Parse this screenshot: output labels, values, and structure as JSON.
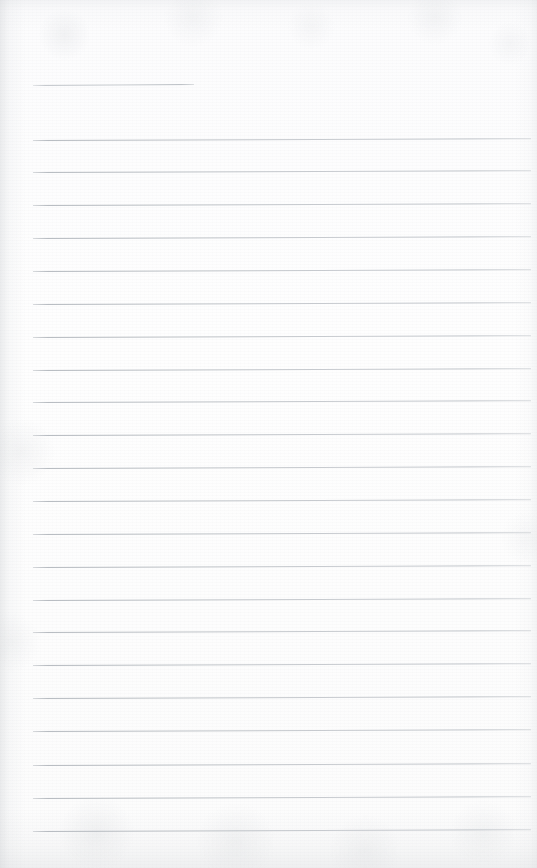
{
  "page": {
    "kind": "blank-lined-notebook-page",
    "width": 537,
    "height": 868,
    "paper_color": "#fdfdfd",
    "rule_color": "#b4b9bf",
    "edge_shadow_color": "#c6c9cd",
    "content_text": "",
    "has_handwriting": false,
    "has_printed_text": false
  },
  "header_rule": {
    "name": "short-header-rule",
    "x": 33,
    "y": 85,
    "width": 161,
    "tilt_deg": -0.35,
    "thickness": 1
  },
  "ruling": {
    "left_margin": 33,
    "right_edge": 531,
    "first_line_y": 140,
    "line_spacing": 32.9,
    "line_count": 22,
    "thickness": 1,
    "tilt_deg": -0.2,
    "lines": [
      {
        "index": 1,
        "y": 140,
        "x": 33,
        "width": 498
      },
      {
        "index": 2,
        "y": 172,
        "x": 33,
        "width": 498
      },
      {
        "index": 3,
        "y": 205,
        "x": 33,
        "width": 498
      },
      {
        "index": 4,
        "y": 238,
        "x": 33,
        "width": 498
      },
      {
        "index": 5,
        "y": 271,
        "x": 33,
        "width": 498
      },
      {
        "index": 6,
        "y": 304,
        "x": 33,
        "width": 498
      },
      {
        "index": 7,
        "y": 337,
        "x": 33,
        "width": 498
      },
      {
        "index": 8,
        "y": 370,
        "x": 33,
        "width": 498
      },
      {
        "index": 9,
        "y": 402,
        "x": 33,
        "width": 498
      },
      {
        "index": 10,
        "y": 435,
        "x": 33,
        "width": 498
      },
      {
        "index": 11,
        "y": 468,
        "x": 33,
        "width": 498
      },
      {
        "index": 12,
        "y": 501,
        "x": 33,
        "width": 498
      },
      {
        "index": 13,
        "y": 534,
        "x": 33,
        "width": 498
      },
      {
        "index": 14,
        "y": 567,
        "x": 33,
        "width": 498
      },
      {
        "index": 15,
        "y": 600,
        "x": 33,
        "width": 498
      },
      {
        "index": 16,
        "y": 632,
        "x": 33,
        "width": 498
      },
      {
        "index": 17,
        "y": 665,
        "x": 33,
        "width": 498
      },
      {
        "index": 18,
        "y": 698,
        "x": 33,
        "width": 498
      },
      {
        "index": 19,
        "y": 731,
        "x": 33,
        "width": 498
      },
      {
        "index": 20,
        "y": 765,
        "x": 33,
        "width": 498
      },
      {
        "index": 21,
        "y": 798,
        "x": 33,
        "width": 498
      },
      {
        "index": 22,
        "y": 831,
        "x": 33,
        "width": 498
      }
    ]
  }
}
